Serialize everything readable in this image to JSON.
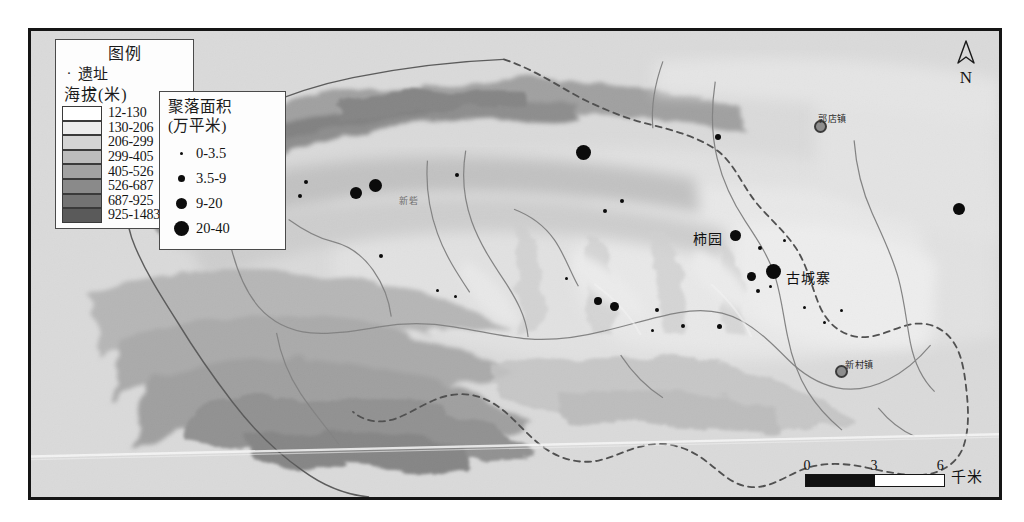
{
  "figure": {
    "kind": "archaeological-settlement-distribution-map",
    "background_color": "#d2d2d2",
    "frame_color": "#151515"
  },
  "north_arrow": {
    "letter": "N",
    "icon": "north-arrow-icon"
  },
  "scale_bar": {
    "ticks": [
      "0",
      "3",
      "6"
    ],
    "unit": "千米",
    "fill_color": "#111111"
  },
  "legend_elevation": {
    "title": "图例",
    "site_symbol": "·",
    "site_label": "遗址",
    "subtitle": "海拔(米)",
    "classes": [
      {
        "range": "12-130",
        "color": "#ffffff"
      },
      {
        "range": "130-206",
        "color": "#ececec"
      },
      {
        "range": "206-299",
        "color": "#d4d4d4"
      },
      {
        "range": "299-405",
        "color": "#bcbcbc"
      },
      {
        "range": "405-526",
        "color": "#a2a2a2"
      },
      {
        "range": "526-687",
        "color": "#8a8a8a"
      },
      {
        "range": "687-925",
        "color": "#737373"
      },
      {
        "range": "925-1483",
        "color": "#5a5a5a"
      }
    ]
  },
  "legend_size": {
    "title_line1": "聚落面积",
    "title_line2": "(万平米)",
    "classes": [
      {
        "range": "0-3.5",
        "dot_px": 3
      },
      {
        "range": "3.5-9",
        "dot_px": 7
      },
      {
        "range": "9-20",
        "dot_px": 11
      },
      {
        "range": "20-40",
        "dot_px": 15
      }
    ]
  },
  "map_labels": [
    {
      "name": "shiyuan",
      "text": "柿园",
      "x": 693,
      "y": 228,
      "type": "site"
    },
    {
      "name": "guchengzhai",
      "text": "古城寨",
      "x": 786,
      "y": 267,
      "type": "site"
    },
    {
      "name": "guodianzhen",
      "text": "郭店镇",
      "x": 818,
      "y": 112,
      "type": "town"
    },
    {
      "name": "xincunzhen",
      "text": "新村镇",
      "x": 845,
      "y": 358,
      "type": "town"
    },
    {
      "name": "xinzhai",
      "text": "新砦",
      "x": 399,
      "y": 194,
      "type": "faint"
    }
  ],
  "towns": [
    {
      "name": "guodianzhen-marker",
      "x": 820,
      "y": 126
    },
    {
      "name": "xincunzhen-marker",
      "x": 841,
      "y": 371
    }
  ],
  "site_dots": [
    {
      "x": 583,
      "y": 152,
      "d": 15
    },
    {
      "x": 375,
      "y": 185,
      "d": 13
    },
    {
      "x": 356,
      "y": 193,
      "d": 12
    },
    {
      "x": 773,
      "y": 271,
      "d": 15
    },
    {
      "x": 735,
      "y": 235,
      "d": 11
    },
    {
      "x": 751,
      "y": 276,
      "d": 9
    },
    {
      "x": 959,
      "y": 209,
      "d": 12
    },
    {
      "x": 598,
      "y": 301,
      "d": 8
    },
    {
      "x": 614,
      "y": 306,
      "d": 9
    },
    {
      "x": 718,
      "y": 137,
      "d": 6
    },
    {
      "x": 719,
      "y": 326,
      "d": 5
    },
    {
      "x": 622,
      "y": 201,
      "d": 4
    },
    {
      "x": 605,
      "y": 211,
      "d": 4
    },
    {
      "x": 657,
      "y": 310,
      "d": 4
    },
    {
      "x": 683,
      "y": 326,
      "d": 4
    },
    {
      "x": 760,
      "y": 248,
      "d": 4
    },
    {
      "x": 784,
      "y": 240,
      "d": 3
    },
    {
      "x": 758,
      "y": 291,
      "d": 4
    },
    {
      "x": 770,
      "y": 286,
      "d": 3
    },
    {
      "x": 804,
      "y": 307,
      "d": 3
    },
    {
      "x": 824,
      "y": 322,
      "d": 3
    },
    {
      "x": 841,
      "y": 310,
      "d": 3
    },
    {
      "x": 195,
      "y": 228,
      "d": 8
    },
    {
      "x": 306,
      "y": 182,
      "d": 4
    },
    {
      "x": 300,
      "y": 196,
      "d": 4
    },
    {
      "x": 457,
      "y": 175,
      "d": 4
    },
    {
      "x": 381,
      "y": 256,
      "d": 4
    },
    {
      "x": 437,
      "y": 290,
      "d": 3
    },
    {
      "x": 455,
      "y": 296,
      "d": 3
    },
    {
      "x": 566,
      "y": 278,
      "d": 3
    },
    {
      "x": 652,
      "y": 330,
      "d": 3
    }
  ],
  "scan_artifact": {
    "description": "diagonal white scan streak across lower map"
  }
}
